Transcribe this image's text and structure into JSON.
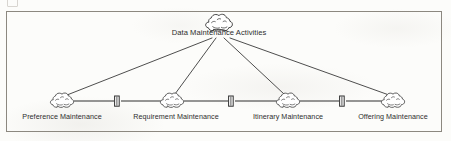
{
  "diagram": {
    "type": "hierarchy-tree",
    "frame": {
      "stroke": "#8c8880",
      "x": 6,
      "y": 11,
      "width": 436,
      "height": 121
    },
    "line_color": "#3a3a3a",
    "text_color": "#2d2d2d",
    "root": {
      "id": "data-maintenance-activities",
      "label": "Data Maintenance Activities",
      "icon": "cloud-icon",
      "cx": 219,
      "cy": 22,
      "label_x": 219,
      "label_y": 32
    },
    "children": [
      {
        "id": "preference-maintenance",
        "label": "Preference Maintenance",
        "icon": "cloud-icon",
        "cx": 62,
        "cy": 101,
        "label_x": 62,
        "label_y": 117
      },
      {
        "id": "requirement-maintenance",
        "label": "Requirement Maintenance",
        "icon": "cloud-icon",
        "cx": 172,
        "cy": 101,
        "label_x": 176,
        "label_y": 117
      },
      {
        "id": "itinerary-maintenance",
        "label": "Itinerary Maintenance",
        "icon": "cloud-icon",
        "cx": 288,
        "cy": 101,
        "label_x": 288,
        "label_y": 117
      },
      {
        "id": "offering-maintenance",
        "label": "Offering Maintenance",
        "icon": "cloud-icon",
        "cx": 393,
        "cy": 101,
        "label_x": 393,
        "label_y": 117
      }
    ],
    "connectors": [
      {
        "id": "bar-1",
        "icon": "bar-connector-icon",
        "cx": 117,
        "cy": 101
      },
      {
        "id": "bar-2",
        "icon": "bar-connector-icon",
        "cx": 231,
        "cy": 101
      },
      {
        "id": "bar-3",
        "icon": "bar-connector-icon",
        "cx": 342,
        "cy": 101
      }
    ],
    "corner_artifact": "scan-artifact-glyph"
  }
}
